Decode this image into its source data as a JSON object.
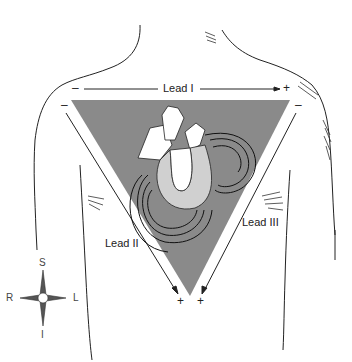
{
  "diagram": {
    "colors": {
      "triangle_fill": "#8a8a8a",
      "line": "#222222",
      "background": "#ffffff"
    },
    "leads": [
      {
        "id": "lead_i",
        "label": "Lead I",
        "neg": "–",
        "pos": "+"
      },
      {
        "id": "lead_ii",
        "label": "Lead II",
        "neg": "–",
        "pos": "+"
      },
      {
        "id": "lead_iii",
        "label": "Lead III",
        "neg": "–",
        "pos": "+"
      }
    ],
    "compass": {
      "superior": "S",
      "inferior": "I",
      "right": "R",
      "left": "L"
    }
  }
}
